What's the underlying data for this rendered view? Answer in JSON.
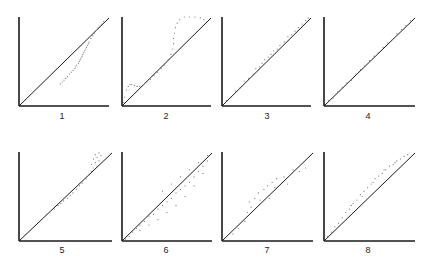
{
  "chart_data": {
    "type": "scatter",
    "title": "",
    "grid": false,
    "axis_range": [
      0,
      1
    ],
    "panels": [
      {
        "label": "1",
        "box": {
          "x0": 19,
          "y0": 17,
          "x1": 109,
          "y1": 106
        },
        "points": [
          [
            0.46,
            0.25
          ],
          [
            0.48,
            0.27
          ],
          [
            0.5,
            0.29
          ],
          [
            0.52,
            0.31
          ],
          [
            0.54,
            0.33
          ],
          [
            0.56,
            0.36
          ],
          [
            0.58,
            0.38
          ],
          [
            0.6,
            0.4
          ],
          [
            0.62,
            0.42
          ],
          [
            0.63,
            0.44
          ],
          [
            0.64,
            0.46
          ],
          [
            0.66,
            0.48
          ],
          [
            0.67,
            0.5
          ],
          [
            0.68,
            0.52
          ],
          [
            0.69,
            0.54
          ],
          [
            0.7,
            0.56
          ],
          [
            0.71,
            0.58
          ],
          [
            0.72,
            0.6
          ],
          [
            0.73,
            0.62
          ],
          [
            0.74,
            0.64
          ],
          [
            0.75,
            0.66
          ],
          [
            0.76,
            0.68
          ],
          [
            0.77,
            0.7
          ],
          [
            0.78,
            0.72
          ],
          [
            0.8,
            0.76
          ],
          [
            0.82,
            0.79
          ],
          [
            0.84,
            0.82
          ],
          [
            0.86,
            0.85
          ],
          [
            0.88,
            0.88
          ],
          [
            0.9,
            0.9
          ],
          [
            0.92,
            0.92
          ],
          [
            0.94,
            0.95
          ]
        ]
      },
      {
        "label": "2",
        "box": {
          "x0": 122,
          "y0": 17,
          "x1": 211,
          "y1": 106
        },
        "points": [
          [
            0.02,
            0.04
          ],
          [
            0.03,
            0.1
          ],
          [
            0.05,
            0.18
          ],
          [
            0.07,
            0.22
          ],
          [
            0.09,
            0.24
          ],
          [
            0.11,
            0.24
          ],
          [
            0.14,
            0.23
          ],
          [
            0.17,
            0.22
          ],
          [
            0.2,
            0.22
          ],
          [
            0.24,
            0.24
          ],
          [
            0.28,
            0.27
          ],
          [
            0.32,
            0.3
          ],
          [
            0.36,
            0.34
          ],
          [
            0.4,
            0.38
          ],
          [
            0.44,
            0.42
          ],
          [
            0.48,
            0.46
          ],
          [
            0.52,
            0.52
          ],
          [
            0.55,
            0.58
          ],
          [
            0.57,
            0.64
          ],
          [
            0.58,
            0.7
          ],
          [
            0.58,
            0.76
          ],
          [
            0.59,
            0.82
          ],
          [
            0.6,
            0.88
          ],
          [
            0.62,
            0.93
          ],
          [
            0.65,
            0.97
          ],
          [
            0.7,
            1.0
          ],
          [
            0.76,
            1.0
          ],
          [
            0.82,
            1.0
          ],
          [
            0.88,
            0.99
          ],
          [
            0.92,
            0.97
          ]
        ]
      },
      {
        "label": "3",
        "box": {
          "x0": 222,
          "y0": 17,
          "x1": 311,
          "y1": 106
        },
        "points": [
          [
            0.05,
            0.06
          ],
          [
            0.1,
            0.1
          ],
          [
            0.15,
            0.17
          ],
          [
            0.2,
            0.2
          ],
          [
            0.25,
            0.28
          ],
          [
            0.3,
            0.31
          ],
          [
            0.35,
            0.36
          ],
          [
            0.38,
            0.42
          ],
          [
            0.42,
            0.44
          ],
          [
            0.45,
            0.48
          ],
          [
            0.48,
            0.52
          ],
          [
            0.52,
            0.55
          ],
          [
            0.55,
            0.58
          ],
          [
            0.58,
            0.62
          ],
          [
            0.62,
            0.64
          ],
          [
            0.65,
            0.68
          ],
          [
            0.7,
            0.72
          ],
          [
            0.74,
            0.78
          ],
          [
            0.78,
            0.8
          ],
          [
            0.82,
            0.84
          ],
          [
            0.86,
            0.88
          ],
          [
            0.9,
            0.92
          ],
          [
            0.94,
            0.96
          ],
          [
            0.97,
            0.99
          ]
        ]
      },
      {
        "label": "4",
        "box": {
          "x0": 324,
          "y0": 17,
          "x1": 415,
          "y1": 106
        },
        "points": [
          [
            0.05,
            0.06
          ],
          [
            0.1,
            0.09
          ],
          [
            0.15,
            0.16
          ],
          [
            0.2,
            0.21
          ],
          [
            0.25,
            0.26
          ],
          [
            0.3,
            0.29
          ],
          [
            0.35,
            0.36
          ],
          [
            0.4,
            0.41
          ],
          [
            0.45,
            0.45
          ],
          [
            0.5,
            0.51
          ],
          [
            0.55,
            0.56
          ],
          [
            0.6,
            0.6
          ],
          [
            0.65,
            0.66
          ],
          [
            0.7,
            0.71
          ],
          [
            0.75,
            0.75
          ],
          [
            0.8,
            0.81
          ],
          [
            0.85,
            0.86
          ],
          [
            0.9,
            0.9
          ],
          [
            0.95,
            0.96
          ]
        ]
      },
      {
        "label": "5",
        "box": {
          "x0": 19,
          "y0": 152,
          "x1": 112,
          "y1": 241
        },
        "points": [
          [
            0.3,
            0.3
          ],
          [
            0.34,
            0.33
          ],
          [
            0.38,
            0.36
          ],
          [
            0.42,
            0.4
          ],
          [
            0.45,
            0.42
          ],
          [
            0.48,
            0.45
          ],
          [
            0.52,
            0.48
          ],
          [
            0.55,
            0.51
          ],
          [
            0.58,
            0.54
          ],
          [
            0.62,
            0.58
          ],
          [
            0.65,
            0.62
          ],
          [
            0.68,
            0.65
          ],
          [
            0.72,
            0.7
          ],
          [
            0.75,
            0.74
          ],
          [
            0.78,
            0.78
          ],
          [
            0.8,
            0.82
          ],
          [
            0.78,
            0.86
          ],
          [
            0.82,
            0.88
          ],
          [
            0.8,
            0.92
          ],
          [
            0.84,
            0.94
          ],
          [
            0.82,
            0.97
          ],
          [
            0.86,
            0.99
          ],
          [
            0.88,
            0.96
          ],
          [
            0.86,
            0.9
          ],
          [
            0.84,
            0.84
          ]
        ]
      },
      {
        "label": "6",
        "box": {
          "x0": 122,
          "y0": 152,
          "x1": 212,
          "y1": 241
        },
        "points": [
          [
            0.04,
            0.02
          ],
          [
            0.08,
            0.05
          ],
          [
            0.12,
            0.1
          ],
          [
            0.16,
            0.14
          ],
          [
            0.2,
            0.18
          ],
          [
            0.25,
            0.22
          ],
          [
            0.3,
            0.28
          ],
          [
            0.35,
            0.3
          ],
          [
            0.4,
            0.36
          ],
          [
            0.45,
            0.4
          ],
          [
            0.5,
            0.44
          ],
          [
            0.55,
            0.48
          ],
          [
            0.6,
            0.54
          ],
          [
            0.65,
            0.58
          ],
          [
            0.7,
            0.62
          ],
          [
            0.75,
            0.66
          ],
          [
            0.8,
            0.72
          ],
          [
            0.85,
            0.78
          ],
          [
            0.9,
            0.84
          ],
          [
            0.95,
            0.9
          ],
          [
            0.2,
            0.12
          ],
          [
            0.3,
            0.18
          ],
          [
            0.4,
            0.24
          ],
          [
            0.5,
            0.32
          ],
          [
            0.6,
            0.4
          ],
          [
            0.7,
            0.5
          ],
          [
            0.8,
            0.62
          ],
          [
            0.9,
            0.76
          ],
          [
            0.45,
            0.56
          ],
          [
            0.55,
            0.64
          ],
          [
            0.65,
            0.72
          ],
          [
            0.75,
            0.8
          ],
          [
            0.85,
            0.88
          ],
          [
            0.95,
            0.96
          ]
        ]
      },
      {
        "label": "7",
        "box": {
          "x0": 222,
          "y0": 152,
          "x1": 313,
          "y1": 241
        },
        "points": [
          [
            0.12,
            0.08
          ],
          [
            0.18,
            0.14
          ],
          [
            0.25,
            0.22
          ],
          [
            0.28,
            0.32
          ],
          [
            0.32,
            0.38
          ],
          [
            0.3,
            0.44
          ],
          [
            0.36,
            0.48
          ],
          [
            0.42,
            0.46
          ],
          [
            0.4,
            0.54
          ],
          [
            0.46,
            0.58
          ],
          [
            0.5,
            0.62
          ],
          [
            0.55,
            0.66
          ],
          [
            0.52,
            0.48
          ],
          [
            0.58,
            0.6
          ],
          [
            0.6,
            0.7
          ],
          [
            0.68,
            0.72
          ],
          [
            0.72,
            0.64
          ],
          [
            0.78,
            0.8
          ],
          [
            0.85,
            0.78
          ],
          [
            0.92,
            0.82
          ]
        ]
      },
      {
        "label": "8",
        "box": {
          "x0": 324,
          "y0": 152,
          "x1": 415,
          "y1": 241
        },
        "points": [
          [
            0.04,
            0.05
          ],
          [
            0.08,
            0.1
          ],
          [
            0.12,
            0.16
          ],
          [
            0.16,
            0.2
          ],
          [
            0.2,
            0.26
          ],
          [
            0.24,
            0.32
          ],
          [
            0.28,
            0.36
          ],
          [
            0.32,
            0.42
          ],
          [
            0.36,
            0.46
          ],
          [
            0.4,
            0.52
          ],
          [
            0.44,
            0.56
          ],
          [
            0.48,
            0.6
          ],
          [
            0.52,
            0.64
          ],
          [
            0.56,
            0.7
          ],
          [
            0.6,
            0.73
          ],
          [
            0.64,
            0.76
          ],
          [
            0.68,
            0.8
          ],
          [
            0.72,
            0.84
          ],
          [
            0.76,
            0.86
          ],
          [
            0.8,
            0.9
          ],
          [
            0.84,
            0.92
          ],
          [
            0.88,
            0.95
          ],
          [
            0.92,
            0.97
          ],
          [
            0.3,
            0.4
          ],
          [
            0.42,
            0.5
          ],
          [
            0.54,
            0.66
          ],
          [
            0.66,
            0.8
          ],
          [
            0.78,
            0.88
          ]
        ]
      }
    ]
  },
  "labels": [
    "1",
    "2",
    "3",
    "4",
    "5",
    "6",
    "7",
    "8"
  ],
  "colors": {
    "axis": "#1a1a1a",
    "points": "#777777",
    "background": "#ffffff"
  }
}
